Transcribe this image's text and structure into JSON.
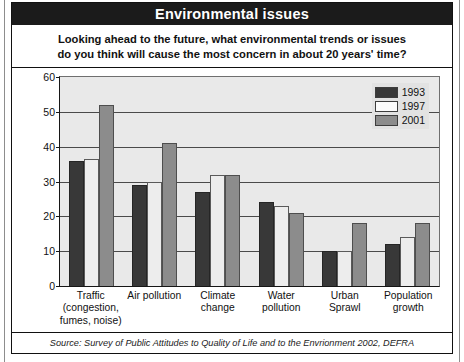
{
  "header": {
    "title": "Environmental issues"
  },
  "subtitle": {
    "line1": "Looking ahead to the future, what environmental trends or issues",
    "line2": "do you think will cause the most concern in about 20 years' time?"
  },
  "footer": {
    "source": "Source: Survey of Public Attitudes to Quality of Life and to the Envrionment 2002, DEFRA"
  },
  "legend": {
    "position": "top-right",
    "items": [
      {
        "label": "1993",
        "color": "#383838"
      },
      {
        "label": "1997",
        "color": "#fbfbfb"
      },
      {
        "label": "2001",
        "color": "#8c8c8c"
      }
    ]
  },
  "axis": {
    "yticks": [
      "0",
      "10",
      "20",
      "30",
      "40",
      "50",
      "60"
    ]
  },
  "chart_data": {
    "type": "bar",
    "title": "Environmental issues",
    "subtitle": "Looking ahead to the future, what environmental trends or issues do you think will cause the most concern in about 20 years' time?",
    "xlabel": "",
    "ylabel": "",
    "ylim": [
      0,
      60
    ],
    "ytick_step": 10,
    "grid": true,
    "legend_position": "top-right",
    "source": "Source: Survey of Public Attitudes to Quality of Life and to the Envrionment 2002, DEFRA",
    "categories": [
      "Traffic (congestion, fumes, noise)",
      "Air pollution",
      "Climate change",
      "Water pollution",
      "Urban Sprawl",
      "Population growth"
    ],
    "category_lines": [
      [
        "Traffic",
        "(congestion,",
        "fumes, noise)"
      ],
      [
        "Air pollution"
      ],
      [
        "Climate",
        "change"
      ],
      [
        "Water",
        "pollution"
      ],
      [
        "Urban",
        "Sprawl"
      ],
      [
        "Population",
        "growth"
      ]
    ],
    "series": [
      {
        "name": "1993",
        "color": "#383838",
        "values": [
          36,
          29,
          27,
          24,
          10,
          12
        ]
      },
      {
        "name": "1997",
        "color": "#ededed",
        "values": [
          36.5,
          30,
          32,
          23,
          10,
          14
        ]
      },
      {
        "name": "2001",
        "color": "#8c8c8c",
        "values": [
          52,
          41,
          32,
          21,
          18,
          18
        ]
      }
    ]
  }
}
